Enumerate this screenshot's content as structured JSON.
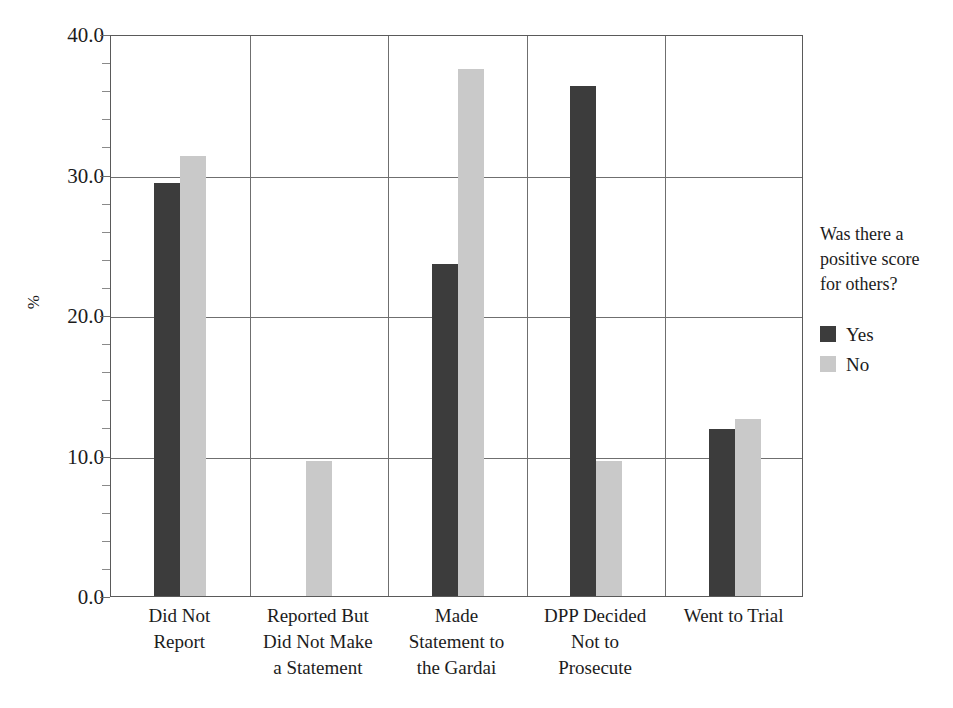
{
  "chart_data": {
    "type": "bar",
    "title": "",
    "xlabel": "",
    "ylabel": "%",
    "ylim": [
      0,
      40
    ],
    "y_ticks": [
      "0.0",
      "10.0",
      "20.0",
      "30.0",
      "40.0"
    ],
    "y_tick_values": [
      0,
      10,
      20,
      30,
      40
    ],
    "grid": true,
    "legend_position": "right",
    "legend_title": "Was there a positive score for others?",
    "categories": [
      "Did Not Report",
      "Reported But Did Not Make a Statement",
      "Made Statement to the Gardai",
      "DPP Decided Not to Prosecute",
      "Went to Trial"
    ],
    "category_lines": [
      [
        "Did Not",
        "Report"
      ],
      [
        "Reported But",
        "Did Not Make",
        "a Statement"
      ],
      [
        "Made",
        "Statement to",
        "the Gardai"
      ],
      [
        "DPP Decided",
        "Not to",
        "Prosecute"
      ],
      [
        "Went to Trial"
      ]
    ],
    "series": [
      {
        "name": "Yes",
        "color": "#3c3c3c",
        "values": [
          29.4,
          0,
          23.6,
          36.3,
          11.9
        ]
      },
      {
        "name": "No",
        "color": "#c9c9c9",
        "values": [
          31.3,
          9.6,
          37.5,
          9.6,
          12.6
        ]
      }
    ]
  },
  "axis": {
    "y_title": "%",
    "y_tick_labels": [
      "40.0",
      "30.0",
      "20.0",
      "10.0",
      "0.0"
    ]
  },
  "legend": {
    "title_lines": [
      "Was there a",
      "positive score",
      "for others?"
    ],
    "entries": [
      {
        "label": "Yes",
        "color": "#3c3c3c"
      },
      {
        "label": "No",
        "color": "#c9c9c9"
      }
    ]
  }
}
